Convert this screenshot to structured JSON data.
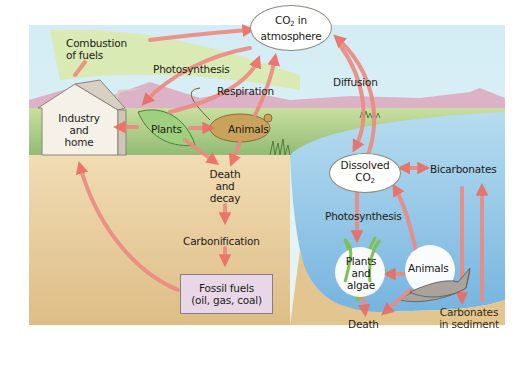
{
  "diagram": {
    "colors": {
      "sky": "#dbeef5",
      "land": "#b9d48c",
      "soil": "#e9cf9f",
      "water": "#8fc3e6",
      "arrow": "#ec7d74",
      "fossil_box": "#e8d7e6",
      "combustion_band": "#d7e6a8"
    },
    "nodes": {
      "co2_atmosphere": {
        "line1": "CO",
        "sub": "2",
        "line1_suffix": " in",
        "line2": "atmosphere"
      },
      "industry": {
        "line1": "Industry",
        "line2": "and",
        "line3": "home"
      },
      "plants": {
        "label": "Plants"
      },
      "animals_land": {
        "label": "Animals"
      },
      "death_decay": {
        "line1": "Death",
        "line2": "and",
        "line3": "decay"
      },
      "carbonification": {
        "label": "Carbonification"
      },
      "fossil_fuels": {
        "line1": "Fossil fuels",
        "line2": "(oil, gas, coal)"
      },
      "dissolved_co2": {
        "line1": "Dissolved",
        "line2": "CO",
        "sub": "2"
      },
      "bicarbonates": {
        "label": "Bicarbonates"
      },
      "plants_algae": {
        "line1": "Plants",
        "line2": "and",
        "line3": "algae"
      },
      "animals_water": {
        "label": "Animals"
      },
      "death_water": {
        "label": "Death"
      },
      "carbonates_sediment": {
        "line1": "Carbonates",
        "line2": "in sediment"
      }
    },
    "processes": {
      "combustion": {
        "line1": "Combustion",
        "line2": "of fuels"
      },
      "photosynthesis_land": "Photosynthesis",
      "respiration": "Respiration",
      "diffusion": "Diffusion",
      "photosynthesis_water": "Photosynthesis"
    },
    "edges": [
      {
        "from": "combustion",
        "to": "co2_atmosphere"
      },
      {
        "from": "co2_atmosphere",
        "to": "plants",
        "label": "Photosynthesis"
      },
      {
        "from": "plants",
        "to": "co2_atmosphere",
        "label": "Respiration"
      },
      {
        "from": "animals_land",
        "to": "co2_atmosphere",
        "label": "Respiration"
      },
      {
        "from": "plants",
        "to": "industry"
      },
      {
        "from": "plants",
        "to": "animals_land"
      },
      {
        "from": "plants",
        "to": "death_decay"
      },
      {
        "from": "animals_land",
        "to": "death_decay"
      },
      {
        "from": "death_decay",
        "to": "carbonification"
      },
      {
        "from": "carbonification",
        "to": "fossil_fuels"
      },
      {
        "from": "fossil_fuels",
        "to": "industry"
      },
      {
        "from": "co2_atmosphere",
        "to": "dissolved_co2",
        "label": "Diffusion"
      },
      {
        "from": "dissolved_co2",
        "to": "co2_atmosphere",
        "label": "Diffusion"
      },
      {
        "from": "dissolved_co2",
        "to": "bicarbonates",
        "bidirectional": true
      },
      {
        "from": "dissolved_co2",
        "to": "plants_algae",
        "label": "Photosynthesis"
      },
      {
        "from": "animals_water",
        "to": "dissolved_co2"
      },
      {
        "from": "animals_water",
        "to": "plants_algae"
      },
      {
        "from": "plants_algae",
        "to": "death_water"
      },
      {
        "from": "animals_water",
        "to": "death_water"
      },
      {
        "from": "bicarbonates",
        "to": "carbonates_sediment"
      },
      {
        "from": "carbonates_sediment",
        "to": "bicarbonates"
      }
    ]
  }
}
